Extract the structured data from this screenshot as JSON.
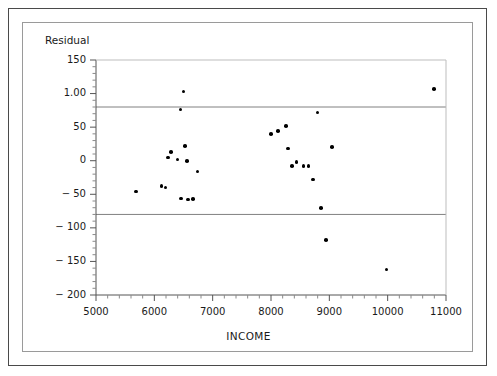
{
  "chart_data": {
    "type": "scatter",
    "title": "",
    "xlabel": "INCOME",
    "ylabel": "Residual",
    "xlim": [
      5000,
      11000
    ],
    "ylim": [
      -200,
      150
    ],
    "xticks": [
      5000,
      6000,
      7000,
      8000,
      9000,
      10000,
      11000
    ],
    "xtick_labels": [
      "5000",
      "6000",
      "7000",
      "8000",
      "9000",
      "10000",
      "11000"
    ],
    "yticks": [
      150,
      100,
      50,
      0,
      -50,
      -100,
      -150,
      -200
    ],
    "ytick_labels": [
      "150",
      "1.00",
      "50",
      "0",
      "− 50",
      "− 100",
      "− 150",
      "− 200"
    ],
    "x_minor_ticks_per_interval": 5,
    "y_minor_ticks_per_interval": 5,
    "grid": false,
    "legend": null,
    "reference_lines": [
      {
        "type": "horizontal",
        "value": 80,
        "color": "#808080"
      },
      {
        "type": "horizontal",
        "value": -80,
        "color": "#808080"
      }
    ],
    "marker_color": "#000000",
    "marker_size": 3.6,
    "points": [
      {
        "x": 5690,
        "y": -46
      },
      {
        "x": 6120,
        "y": -38
      },
      {
        "x": 6190,
        "y": -40
      },
      {
        "x": 6230,
        "y": 5
      },
      {
        "x": 6290,
        "y": 13
      },
      {
        "x": 6400,
        "y": 2
      },
      {
        "x": 6450,
        "y": 76
      },
      {
        "x": 6460,
        "y": -56
      },
      {
        "x": 6500,
        "y": 103
      },
      {
        "x": 6530,
        "y": 22
      },
      {
        "x": 6560,
        "y": 0
      },
      {
        "x": 6580,
        "y": -58
      },
      {
        "x": 6660,
        "y": -57
      },
      {
        "x": 6740,
        "y": -16
      },
      {
        "x": 8000,
        "y": 40
      },
      {
        "x": 8120,
        "y": 44
      },
      {
        "x": 8260,
        "y": 52
      },
      {
        "x": 8290,
        "y": 18
      },
      {
        "x": 8360,
        "y": -8
      },
      {
        "x": 8440,
        "y": -2
      },
      {
        "x": 8560,
        "y": -8
      },
      {
        "x": 8640,
        "y": -8
      },
      {
        "x": 8720,
        "y": -28
      },
      {
        "x": 8800,
        "y": 72
      },
      {
        "x": 8860,
        "y": -70
      },
      {
        "x": 8940,
        "y": -118
      },
      {
        "x": 9050,
        "y": 20
      },
      {
        "x": 9980,
        "y": -162
      },
      {
        "x": 10790,
        "y": 107
      }
    ]
  },
  "figure": {
    "y_axis_title": "Residual",
    "x_axis_title": "INCOME"
  }
}
